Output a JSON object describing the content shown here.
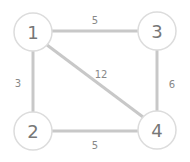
{
  "graph": {
    "nodes": [
      {
        "id": "1",
        "label": "1"
      },
      {
        "id": "2",
        "label": "2"
      },
      {
        "id": "3",
        "label": "3"
      },
      {
        "id": "4",
        "label": "4"
      }
    ],
    "edges": [
      {
        "from": "1",
        "to": "3",
        "weight": "5"
      },
      {
        "from": "1",
        "to": "2",
        "weight": "3"
      },
      {
        "from": "1",
        "to": "4",
        "weight": "12"
      },
      {
        "from": "3",
        "to": "4",
        "weight": "6"
      },
      {
        "from": "2",
        "to": "4",
        "weight": "5"
      }
    ]
  }
}
